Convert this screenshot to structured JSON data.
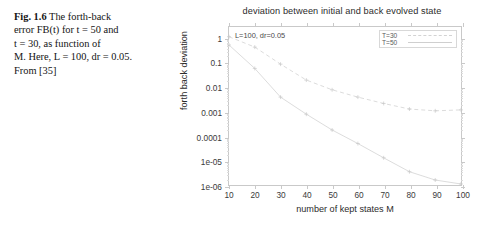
{
  "caption": {
    "fig_number": "Fig. 1.6",
    "line1_rest": "The forth-back",
    "line2": "error FB(t) for t = 50 and",
    "line3": "t = 30, as function of",
    "line4": "M. Here, L = 100, dr = 0.05.",
    "line5": "From [35]"
  },
  "figure": {
    "annotation": "L=100, dr=0.05",
    "legend": {
      "entries": [
        {
          "label": "T=30",
          "style": "dashed"
        },
        {
          "label": "T=50",
          "style": "solid"
        }
      ]
    }
  },
  "chart_data": {
    "type": "line",
    "title": "deviation between initial and back evolved state",
    "xlabel": "number of kept states M",
    "ylabel": "forth back deviation",
    "xlim": [
      10,
      100
    ],
    "ylim": [
      1e-06,
      3
    ],
    "yscale": "log",
    "xscale": "linear",
    "grid": false,
    "legend_position": "top-right",
    "xticks": [
      10,
      20,
      30,
      40,
      50,
      60,
      70,
      80,
      90,
      100
    ],
    "xticklabels": [
      "10",
      "20",
      "30",
      "40",
      "50",
      "60",
      "70",
      "80",
      "90",
      "100"
    ],
    "yticks": [
      1,
      0.1,
      0.01,
      0.001,
      0.0001,
      1e-05,
      1e-06
    ],
    "yticklabels": [
      "1",
      "0.1",
      "0.01",
      "0.001",
      "0.0001",
      "1e-05",
      "1e-06"
    ],
    "x": [
      10,
      20,
      30,
      40,
      50,
      60,
      70,
      80,
      90,
      100
    ],
    "series": [
      {
        "name": "T=30",
        "style": "dashed",
        "values": [
          1.2,
          0.45,
          0.09,
          0.02,
          0.008,
          0.004,
          0.0022,
          0.0013,
          0.0011,
          0.0012
        ]
      },
      {
        "name": "T=50",
        "style": "solid",
        "values": [
          0.55,
          0.06,
          0.004,
          0.0008,
          0.00018,
          5e-05,
          1.3e-05,
          3.5e-06,
          1.6e-06,
          1.1e-06
        ]
      }
    ]
  }
}
